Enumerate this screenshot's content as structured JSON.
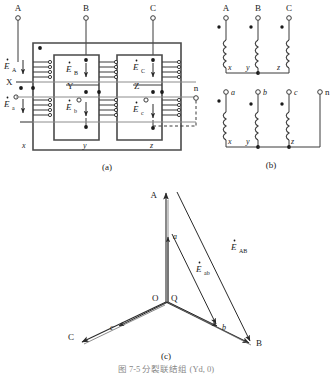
{
  "figure": {
    "title": "图 7-5   分裂联结组 (Yd, 0)",
    "panels": [
      {
        "id": "a",
        "caption": "(a)",
        "name": "core-and-winding-layout"
      },
      {
        "id": "b",
        "caption": "(b)",
        "name": "winding-connection-schematic"
      },
      {
        "id": "c",
        "caption": "(c)",
        "name": "phasor-diagram"
      }
    ]
  },
  "panel_a": {
    "terminals_top": [
      "A",
      "B",
      "C"
    ],
    "terminal_right": "n",
    "emf_primary": [
      {
        "symbol": "E",
        "sub": "A"
      },
      {
        "symbol": "E",
        "sub": "B"
      },
      {
        "symbol": "E",
        "sub": "C"
      }
    ],
    "emf_secondary": [
      {
        "symbol": "E",
        "sub": "a"
      },
      {
        "symbol": "E",
        "sub": "b"
      },
      {
        "symbol": "E",
        "sub": "c"
      }
    ],
    "mid_labels": [
      "X",
      "Y",
      "Z"
    ],
    "bottom_labels": [
      "x",
      "y",
      "z"
    ]
  },
  "panel_b": {
    "top_terminals": [
      "A",
      "B",
      "C"
    ],
    "top_bottom_labels": [
      "x",
      "y",
      "z"
    ],
    "bottom_terminals": [
      "a",
      "b",
      "c",
      "n"
    ],
    "bottom_bottom_labels": [
      "x",
      "y",
      "z"
    ]
  },
  "panel_c": {
    "outer_vertices": [
      "A",
      "B",
      "C"
    ],
    "inner_vertices": [
      "a",
      "b",
      "c"
    ],
    "origin_labels": [
      "O",
      "Q"
    ],
    "phasor_labels": [
      {
        "symbol": "E",
        "sub": "AB"
      },
      {
        "symbol": "E",
        "sub": "ab"
      }
    ]
  },
  "colors": {
    "line": "#3a3a3a",
    "line_light": "#6e6e6e",
    "text": "#1a1a1a",
    "background": "#ffffff"
  }
}
